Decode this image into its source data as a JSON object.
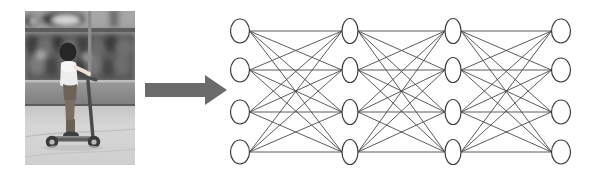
{
  "figure": {
    "caption": "",
    "background_color": "#ffffff"
  },
  "photo": {
    "name": "child-on-kick-scooter-photo",
    "description": "Grayscale photograph of a child riding a kick scooter on pavement in front of a low wall with a blurred crowd behind",
    "alt_text": "child riding a kick scooter",
    "is_grayscale": true,
    "frame": {
      "x": 25,
      "y": 11,
      "width": 110,
      "height": 154
    },
    "regions": [
      {
        "label": "upper-stands-band",
        "color": "#8c8c8c"
      },
      {
        "label": "dark-crowd-band",
        "color": "#4f4f4f"
      },
      {
        "label": "wall-band",
        "color": "#8a8a8a"
      },
      {
        "label": "pavement",
        "color": "#d2d2d2"
      }
    ],
    "subject": {
      "label": "child-rider",
      "shirt_color": "#ededed",
      "skin_color": "#6d6258",
      "hair_color": "#2a2a2a"
    },
    "scooter": {
      "label": "kick-scooter",
      "frame_color": "#5f5f5f",
      "wheel_color": "#3a3a3a"
    }
  },
  "arrow": {
    "name": "transformation-arrow",
    "direction": "right",
    "color": "#6b6b6b",
    "label": ""
  },
  "network": {
    "name": "fully-connected-neural-network",
    "title": "",
    "node_fill": "#ffffff",
    "node_stroke": "#3b3b3b",
    "edge_color": "#4a4a4a",
    "layer_count": 4,
    "nodes_per_layer": 4,
    "layers": [
      {
        "name": "input-layer",
        "label": "",
        "cx": 15,
        "rx": 9.5,
        "ry": 12,
        "nodes": [
          {
            "label": "",
            "cy": 31
          },
          {
            "label": "",
            "cy": 70
          },
          {
            "label": "",
            "cy": 112
          },
          {
            "label": "",
            "cy": 152
          }
        ]
      },
      {
        "name": "hidden-layer-1",
        "label": "",
        "cx": 125,
        "rx": 8,
        "ry": 12.5,
        "nodes": [
          {
            "label": "",
            "cy": 31
          },
          {
            "label": "",
            "cy": 70
          },
          {
            "label": "",
            "cy": 112
          },
          {
            "label": "",
            "cy": 152
          }
        ]
      },
      {
        "name": "hidden-layer-2",
        "label": "",
        "cx": 228,
        "rx": 8,
        "ry": 12.5,
        "nodes": [
          {
            "label": "",
            "cy": 31
          },
          {
            "label": "",
            "cy": 70
          },
          {
            "label": "",
            "cy": 112
          },
          {
            "label": "",
            "cy": 152
          }
        ]
      },
      {
        "name": "output-layer",
        "label": "",
        "cx": 336,
        "rx": 9.5,
        "ry": 12,
        "nodes": [
          {
            "label": "",
            "cy": 31
          },
          {
            "label": "",
            "cy": 70
          },
          {
            "label": "",
            "cy": 112
          },
          {
            "label": "",
            "cy": 152
          }
        ]
      }
    ]
  }
}
